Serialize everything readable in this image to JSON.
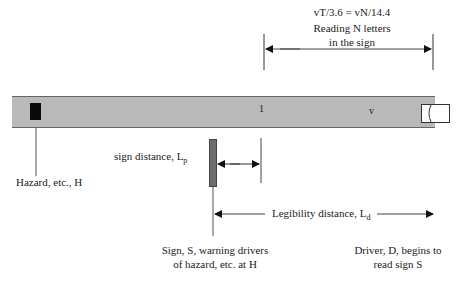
{
  "top_annotation": {
    "formula": "vT/3.6 = vN/14.4",
    "line2": "Reading N letters",
    "line3": "in the sign"
  },
  "road": {
    "point_label": "1",
    "speed_label": "v",
    "color": "#b9b9b9"
  },
  "labels": {
    "hazard": "Hazard, etc., H",
    "sign_distance": "sign distance, L",
    "sign_distance_sub": "p",
    "legibility_distance": "Legibility distance, L",
    "legibility_distance_sub": "d",
    "sign_line1": "Sign, S, warning drivers",
    "sign_line2": "of hazard, etc. at H",
    "driver_line1": "Driver, D, begins to",
    "driver_line2": "read sign S"
  },
  "icons": {
    "hazard": "black-rectangle",
    "sign": "gray-vertical-bar",
    "vehicle": "car-outline",
    "arrows": "filled-triangle-arrowheads"
  }
}
